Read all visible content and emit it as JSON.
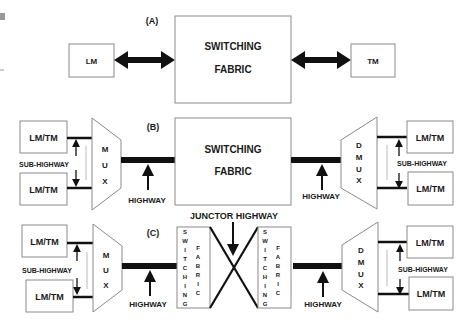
{
  "panels": {
    "a": {
      "label": "(A)",
      "left_box": "LM",
      "fabric_line1": "SWITCHING",
      "fabric_line2": "FABRIC",
      "right_box": "TM"
    },
    "b": {
      "label": "(B)",
      "left_boxes": [
        "LM/TM",
        "LM/TM"
      ],
      "sub_highway_left": "SUB-HIGHWAY",
      "mux_letters": [
        "M",
        "U",
        "X"
      ],
      "highway_left": "HIGHWAY",
      "fabric_line1": "SWITCHING",
      "fabric_line2": "FABRIC",
      "highway_right": "HIGHWAY",
      "dmux_letters": [
        "D",
        "M",
        "U",
        "X"
      ],
      "sub_highway_right": "SUB-HIGHWAY",
      "right_boxes": [
        "LM/TM",
        "LM/TM"
      ]
    },
    "c": {
      "label": "(C)",
      "junctor_label": "JUNCTOR HIGHWAY",
      "left_boxes": [
        "LM/TM",
        "LM/TM"
      ],
      "sub_highway_left": "SUB-HIGHWAY",
      "mux_letters": [
        "M",
        "U",
        "X"
      ],
      "highway_left": "HIGHWAY",
      "fabric_col1": [
        "S",
        "W",
        "I",
        "T",
        "C",
        "H",
        "I",
        "N",
        "G"
      ],
      "fabric_col2": [
        "F",
        "A",
        "B",
        "R",
        "I",
        "C"
      ],
      "highway_right": "HIGHWAY",
      "dmux_letters": [
        "D",
        "M",
        "U",
        "X"
      ],
      "sub_highway_right": "SUB-HIGHWAY",
      "right_boxes": [
        "LM/TM",
        "LM/TM"
      ]
    }
  },
  "colors": {
    "stroke": "#8a8a8a",
    "ink": "#111111",
    "text": "#1a1a1a"
  }
}
